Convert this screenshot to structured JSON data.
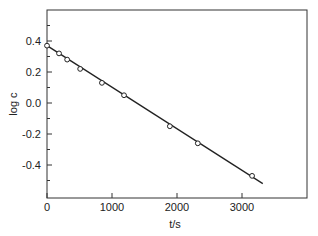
{
  "chart_data": {
    "type": "scatter",
    "title": "",
    "xlabel": "t/s",
    "ylabel": "log c",
    "xlim": [
      0,
      4000
    ],
    "ylim": [
      -0.6,
      0.6
    ],
    "grid": false,
    "legend": null,
    "x_ticks": [
      0,
      1000,
      2000,
      3000
    ],
    "x_tick_labels": [
      "0",
      "1000",
      "2000",
      "3000"
    ],
    "y_ticks": [
      0.4,
      0.2,
      0.0,
      -0.2,
      -0.4
    ],
    "y_tick_labels": [
      "0.4",
      "0.2",
      "0.0",
      "-0.2",
      "-0.4"
    ],
    "series": [
      {
        "name": "data",
        "marker": "open-circle",
        "x": [
          0,
          185,
          310,
          510,
          845,
          1185,
          1890,
          2320,
          3155
        ],
        "y": [
          0.37,
          0.32,
          0.28,
          0.22,
          0.13,
          0.05,
          -0.15,
          -0.26,
          -0.47
        ]
      },
      {
        "name": "linear fit",
        "style": "line",
        "x": [
          0,
          3320
        ],
        "y": [
          0.37,
          -0.52
        ]
      }
    ]
  }
}
